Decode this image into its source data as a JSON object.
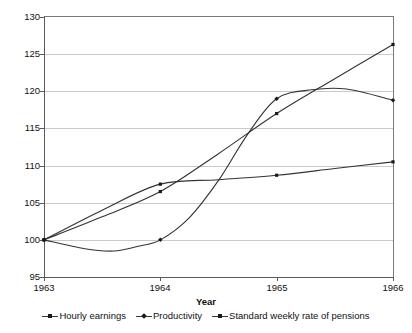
{
  "chart_data": {
    "type": "line",
    "title": "",
    "subtitle": "",
    "xlabel": "Year",
    "ylabel": "",
    "x": [
      1963,
      1964,
      1965,
      1966
    ],
    "xtick_labels": [
      "1963",
      "1964",
      "1965",
      "1966"
    ],
    "ytick_labels": [
      "95",
      "100",
      "105",
      "110",
      "115",
      "120",
      "125",
      "130"
    ],
    "ytick_values": [
      95,
      100,
      105,
      110,
      115,
      120,
      125,
      130
    ],
    "ylim": [
      95,
      130
    ],
    "xlim": [
      1963,
      1966
    ],
    "grid": true,
    "grid_axis": "y",
    "legend_position": "bottom",
    "series": [
      {
        "name": "Hourly earnings",
        "marker": "square",
        "color": "#333333",
        "values": [
          100,
          106.5,
          117,
          126.3
        ],
        "curve": "smooth"
      },
      {
        "name": "Productivity",
        "marker": "diamond",
        "color": "#333333",
        "values": [
          100,
          100,
          119,
          118.8
        ],
        "curve": "smooth",
        "note": "dips to about 98.5 during 1963-64 then rises steeply"
      },
      {
        "name": "Standard weekly rate of pensions",
        "marker": "square",
        "color": "#333333",
        "values": [
          100,
          107.5,
          108.7,
          110.5
        ],
        "curve": "smooth"
      }
    ],
    "annotations": []
  },
  "legend": {
    "items": [
      {
        "label": "Hourly earnings"
      },
      {
        "label": "Productivity"
      },
      {
        "label": "Standard weekly rate of pensions"
      }
    ]
  },
  "axes": {
    "x_title": "Year"
  }
}
